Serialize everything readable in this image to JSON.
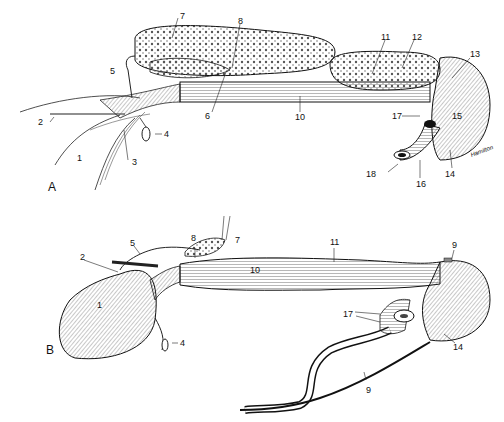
{
  "panels": [
    {
      "id": "A",
      "label": "A",
      "labels": [
        "1",
        "2",
        "3",
        "4",
        "5",
        "6",
        "7",
        "8",
        "10",
        "11",
        "12",
        "13",
        "14",
        "15",
        "16",
        "17",
        "18"
      ]
    },
    {
      "id": "B",
      "label": "B",
      "labels": [
        "1",
        "2",
        "4",
        "5",
        "7",
        "8",
        "9",
        "9",
        "10",
        "11",
        "14",
        "17"
      ]
    }
  ],
  "signature": "Hamilton"
}
